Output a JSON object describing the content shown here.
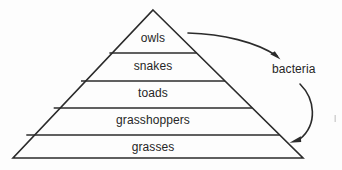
{
  "diagram": {
    "type": "energy-pyramid",
    "background_color": "#fdfdfd",
    "line_color": "#2b2b2b",
    "text_color": "#262626",
    "tiers": [
      {
        "id": "tier-1",
        "label": "owls",
        "level": 5,
        "center_x": 153,
        "center_y": 38
      },
      {
        "id": "tier-2",
        "label": "snakes",
        "level": 4,
        "center_x": 153,
        "center_y": 66
      },
      {
        "id": "tier-3",
        "label": "toads",
        "level": 3,
        "center_x": 153,
        "center_y": 93
      },
      {
        "id": "tier-4",
        "label": "grasshoppers",
        "level": 2,
        "center_x": 153,
        "center_y": 120
      },
      {
        "id": "tier-5",
        "label": "grasses",
        "level": 1,
        "center_x": 153,
        "center_y": 147
      }
    ],
    "side_labels": [
      {
        "id": "decomposer",
        "label": "bacteria",
        "x": 272,
        "y": 62
      }
    ],
    "arrows": [
      {
        "id": "arrow-owls-to-bacteria",
        "from": "owls",
        "to": "bacteria",
        "direction": "right-down"
      },
      {
        "id": "arrow-bacteria-to-grasses",
        "from": "bacteria",
        "to": "grasses",
        "direction": "down-left"
      }
    ]
  }
}
